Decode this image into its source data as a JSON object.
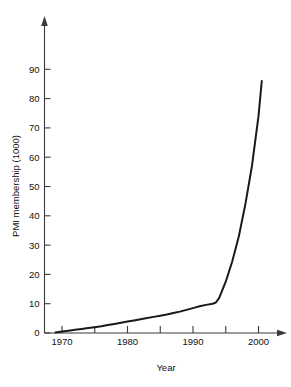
{
  "chart_data": {
    "type": "line",
    "title": "",
    "xlabel": "Year",
    "ylabel": "PMI membership (1000)",
    "xlim": [
      1968.2,
      2003.5
    ],
    "ylim": [
      0,
      93
    ],
    "grid": false,
    "legend": null,
    "x_ticks_major": [
      1970,
      1980,
      1990,
      2000
    ],
    "x_tick_labels": [
      "1970",
      "1980",
      "1990",
      "2000"
    ],
    "x_ticks_minor": [
      1975,
      1985,
      1995
    ],
    "y_ticks": [
      0,
      10,
      20,
      30,
      40,
      50,
      60,
      70,
      80,
      90
    ],
    "y_tick_labels": [
      "0",
      "10",
      "20",
      "30",
      "40",
      "50",
      "60",
      "70",
      "80",
      "90"
    ],
    "series": [
      {
        "name": "PMI membership",
        "color": "#1a1a1a",
        "x": [
          1969.0,
          1970.0,
          1971.0,
          1972.0,
          1973.0,
          1974.0,
          1975.0,
          1976.0,
          1977.0,
          1978.0,
          1979.0,
          1980.0,
          1981.0,
          1982.0,
          1983.0,
          1984.0,
          1985.0,
          1986.0,
          1987.0,
          1988.0,
          1989.0,
          1990.0,
          1991.0,
          1992.0,
          1993.0,
          1993.5,
          1994.0,
          1995.0,
          1996.0,
          1997.0,
          1998.0,
          1999.0,
          2000.0,
          2000.5
        ],
        "y": [
          0.2,
          0.5,
          0.8,
          1.1,
          1.4,
          1.7,
          2.0,
          2.3,
          2.7,
          3.1,
          3.5,
          3.9,
          4.3,
          4.7,
          5.1,
          5.5,
          5.9,
          6.3,
          6.8,
          7.3,
          7.9,
          8.5,
          9.1,
          9.6,
          10.0,
          10.4,
          12.0,
          17.5,
          24.5,
          33.0,
          44.0,
          57.0,
          74.0,
          86.0
        ]
      }
    ]
  },
  "axis": {
    "x_arrow": "arrow-right",
    "y_arrow": "arrow-up"
  }
}
